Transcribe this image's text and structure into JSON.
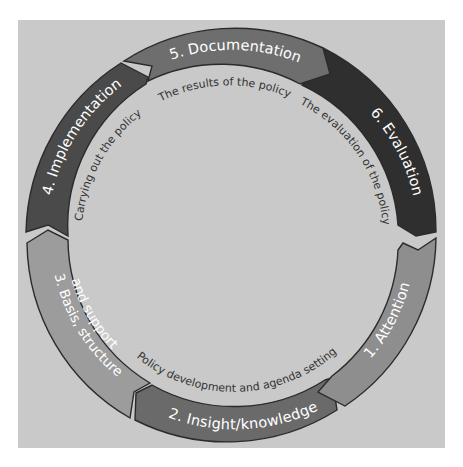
{
  "diagram": {
    "type": "cycle",
    "stages": [
      {
        "number": "1",
        "label": "1. Attention",
        "color": "#8e8e8e"
      },
      {
        "number": "2",
        "label": "2. Insight/knowledge",
        "color": "#6a6a6a"
      },
      {
        "number": "3",
        "label_line1": "3. Basis, structure",
        "label_line2": "and support",
        "color": "#9c9c9c"
      },
      {
        "number": "4",
        "label": "4. Implementation",
        "color": "#4a4a4a"
      },
      {
        "number": "5",
        "label": "5. Documentation",
        "color": "#6e6e6e"
      },
      {
        "number": "6",
        "label": "6. Evaluation",
        "color": "#2f2f2f"
      }
    ],
    "phases": [
      {
        "label": "Policy development and agenda setting"
      },
      {
        "label": "Carrying out the policy"
      },
      {
        "label": "The results of the policy"
      },
      {
        "label": "The evaluation of the policy"
      }
    ],
    "background_color": "#c9c9c9"
  }
}
